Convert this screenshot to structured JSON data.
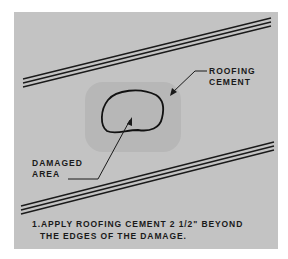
{
  "diagram": {
    "labels": {
      "roofing_cement": [
        "ROOFING",
        "CEMENT"
      ],
      "damaged_area": [
        "DAMAGED",
        "AREA"
      ]
    },
    "caption": {
      "line1": "1.APPLY ROOFING CEMENT 2 1/2\" BEYOND",
      "line2": "THE EDGES OF THE DAMAGE."
    },
    "colors": {
      "background": "#c3c3c3",
      "cement_patch": "#b4b4b4",
      "ink": "#1a1a1a"
    }
  }
}
